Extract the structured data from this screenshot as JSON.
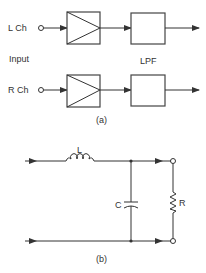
{
  "figure_a": {
    "caption": "(a)",
    "input_label": "Input",
    "lpf_label": "LPF",
    "channels": [
      {
        "label": "L Ch"
      },
      {
        "label": "R Ch"
      }
    ]
  },
  "figure_b": {
    "caption": "(b)",
    "components": {
      "inductor": "L",
      "capacitor": "C",
      "resistor": "R"
    }
  },
  "colors": {
    "stroke": "#333333",
    "background": "#ffffff"
  }
}
